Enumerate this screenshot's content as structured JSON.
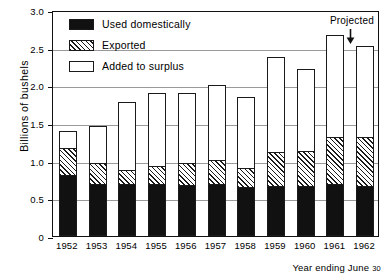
{
  "chart_data": {
    "type": "bar",
    "stacked": true,
    "title": "",
    "xlabel": "Year ending June 30",
    "ylabel": "Billions of bushels",
    "ylim": [
      0,
      3.0
    ],
    "yticks": [
      "0",
      "0.5",
      "1.0",
      "1.5",
      "2.0",
      "2.5",
      "3.0"
    ],
    "ytick_values": [
      0,
      0.5,
      1.0,
      1.5,
      2.0,
      2.5,
      3.0
    ],
    "grid": true,
    "legend_position": "upper-left inside plot",
    "categories": [
      "1952",
      "1953",
      "1954",
      "1955",
      "1956",
      "1957",
      "1958",
      "1959",
      "1960",
      "1961",
      "1962"
    ],
    "series": [
      {
        "name": "Used domestically",
        "key": "used_domestically",
        "values": [
          0.79,
          0.67,
          0.67,
          0.66,
          0.65,
          0.66,
          0.63,
          0.64,
          0.64,
          0.66,
          0.64
        ]
      },
      {
        "name": "Exported",
        "key": "exported",
        "values": [
          0.36,
          0.28,
          0.19,
          0.26,
          0.3,
          0.33,
          0.26,
          0.46,
          0.48,
          0.64,
          0.66
        ]
      },
      {
        "name": "Added to surplus",
        "key": "added_to_surplus",
        "values": [
          0.25,
          0.51,
          0.92,
          0.98,
          0.95,
          1.02,
          0.96,
          1.28,
          1.1,
          1.37,
          1.22
        ]
      }
    ],
    "totals": [
      1.4,
      1.46,
      1.78,
      1.9,
      1.9,
      2.01,
      1.85,
      2.38,
      2.22,
      2.67,
      2.52
    ],
    "annotations": [
      {
        "text": "Projected",
        "target_category": "1962",
        "marker": "down-arrow"
      }
    ]
  },
  "legend": {
    "items": [
      {
        "label": "Used domestically",
        "pattern": "solid-black"
      },
      {
        "label": "Exported",
        "pattern": "diagonal-hatch"
      },
      {
        "label": "Added to surplus",
        "pattern": "white-outline"
      }
    ]
  },
  "axis": {
    "y_title": "Billions of bushels",
    "x_title_main": "Year ending June",
    "x_title_suffix": "30"
  },
  "annotation": {
    "projected_label": "Projected"
  }
}
